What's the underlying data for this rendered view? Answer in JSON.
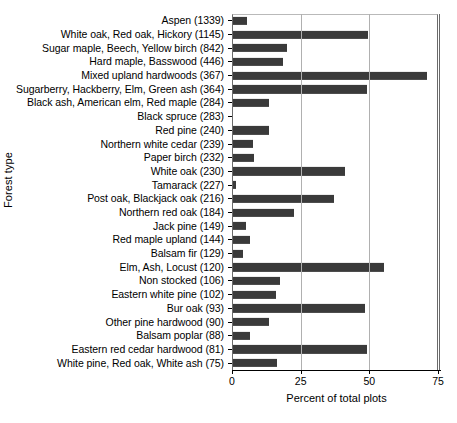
{
  "chart_data": {
    "type": "bar",
    "orientation": "horizontal",
    "title": "",
    "xlabel": "Percent of total plots",
    "ylabel": "Forest type",
    "xlim": [
      0,
      75
    ],
    "ylim": null,
    "xticks": [
      0,
      25,
      50,
      75
    ],
    "xticklabels": [
      "0",
      "25",
      "50",
      "75"
    ],
    "grid": "vertical gridlines at 25 and 50",
    "legend": null,
    "bar_color": "#3a3a3a",
    "categories": [
      "Aspen  (1339)",
      "White oak, Red oak, Hickory  (1145)",
      "Sugar maple, Beech, Yellow birch  (842)",
      "Hard maple, Basswood  (446)",
      "Mixed upland hardwoods  (367)",
      "Sugarberry, Hackberry, Elm, Green ash  (364)",
      "Black ash, American elm, Red maple  (284)",
      "Black spruce  (283)",
      "Red pine  (240)",
      "Northern white cedar  (239)",
      "Paper birch  (232)",
      "White oak  (230)",
      "Tamarack  (227)",
      "Post oak, Blackjack oak  (216)",
      "Northern red oak  (184)",
      "Jack pine  (149)",
      "Red maple upland  (144)",
      "Balsam fir  (129)",
      "Elm, Ash, Locust  (120)",
      "Non stocked  (106)",
      "Eastern white pine  (102)",
      "Bur oak  (93)",
      "Other pine hardwood  (90)",
      "Balsam poplar  (88)",
      "Eastern red cedar hardwood  (81)",
      "White pine, Red oak, White ash  (75)"
    ],
    "category_names": [
      "Aspen",
      "White oak, Red oak, Hickory",
      "Sugar maple, Beech, Yellow birch",
      "Hard maple, Basswood",
      "Mixed upland hardwoods",
      "Sugarberry, Hackberry, Elm, Green ash",
      "Black ash, American elm, Red maple",
      "Black spruce",
      "Red pine",
      "Northern white cedar",
      "Paper birch",
      "White oak",
      "Tamarack",
      "Post oak, Blackjack oak",
      "Northern red oak",
      "Jack pine",
      "Red maple upland",
      "Balsam fir",
      "Elm, Ash, Locust",
      "Non stocked",
      "Eastern white pine",
      "Bur oak",
      "Other pine hardwood",
      "Balsam poplar",
      "Eastern red cedar hardwood",
      "White pine, Red oak, White ash"
    ],
    "counts": [
      1339,
      1145,
      842,
      446,
      367,
      364,
      284,
      283,
      240,
      239,
      232,
      230,
      227,
      216,
      184,
      149,
      144,
      129,
      120,
      106,
      102,
      93,
      90,
      88,
      81,
      75
    ],
    "values": [
      5.5,
      49.5,
      20.0,
      18.5,
      71.0,
      49.0,
      13.5,
      0.5,
      13.5,
      7.5,
      8.0,
      41.0,
      1.5,
      37.0,
      22.5,
      5.0,
      6.5,
      4.0,
      55.5,
      17.5,
      16.0,
      48.5,
      13.5,
      6.5,
      49.0,
      16.5
    ]
  }
}
